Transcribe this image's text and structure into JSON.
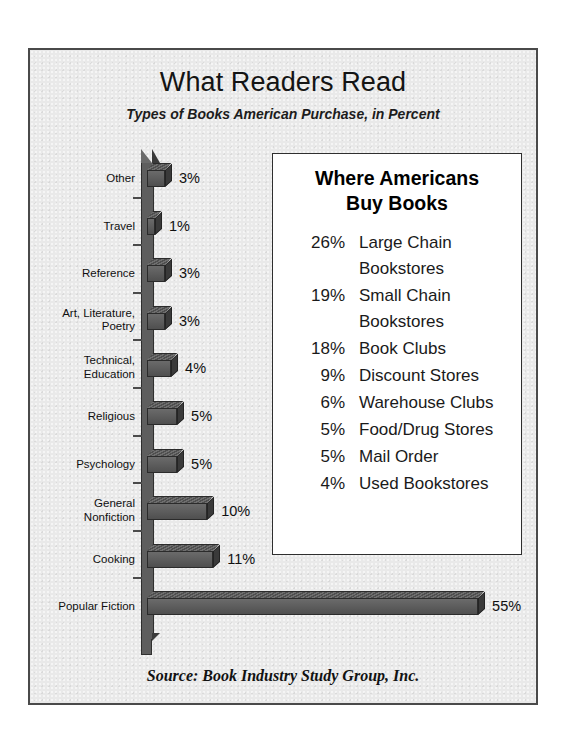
{
  "poster": {
    "title": "What Readers Read",
    "subtitle": "Types of Books American Purchase, in Percent",
    "source": "Source:  Book Industry Study Group, Inc."
  },
  "panel": {
    "title_line1": "Where Americans",
    "title_line2": "Buy Books",
    "items": [
      {
        "pct": "26%",
        "label": "Large Chain",
        "label2": "Bookstores"
      },
      {
        "pct": "19%",
        "label": "Small Chain",
        "label2": "Bookstores"
      },
      {
        "pct": "18%",
        "label": "Book Clubs",
        "label2": ""
      },
      {
        "pct": "9%",
        "label": "Discount Stores",
        "label2": ""
      },
      {
        "pct": "6%",
        "label": "Warehouse Clubs",
        "label2": ""
      },
      {
        "pct": "5%",
        "label": "Food/Drug Stores",
        "label2": ""
      },
      {
        "pct": "5%",
        "label": "Mail Order",
        "label2": ""
      },
      {
        "pct": "4%",
        "label": "Used Bookstores",
        "label2": ""
      }
    ]
  },
  "chart_data": {
    "type": "bar",
    "orientation": "horizontal",
    "title": "What Readers Read",
    "subtitle": "Types of Books American Purchase, in Percent",
    "xlabel": "",
    "ylabel": "",
    "xlim": [
      0,
      55
    ],
    "grid": false,
    "legend": false,
    "value_suffix": "%",
    "categories": [
      "Other",
      "Travel",
      "Reference",
      "Art, Literature, Poetry",
      "Technical, Education",
      "Religious",
      "Psychology",
      "General Nonfiction",
      "Cooking",
      "Popular Fiction"
    ],
    "category_lines": [
      [
        "Other"
      ],
      [
        "Travel"
      ],
      [
        "Reference"
      ],
      [
        "Art, Literature,",
        "Poetry"
      ],
      [
        "Technical,",
        "Education"
      ],
      [
        "Religious"
      ],
      [
        "Psychology"
      ],
      [
        "General",
        "Nonfiction"
      ],
      [
        "Cooking"
      ],
      [
        "Popular Fiction"
      ]
    ],
    "values": [
      3,
      1,
      3,
      3,
      4,
      5,
      5,
      10,
      11,
      55
    ],
    "value_labels": [
      "3%",
      "1%",
      "3%",
      "3%",
      "4%",
      "5%",
      "5%",
      "10%",
      "11%",
      "55%"
    ],
    "bar_face_color": "#5a5a5a",
    "bar_edge_color": "#2b2b2b",
    "background_color": "#e9e9e9"
  }
}
